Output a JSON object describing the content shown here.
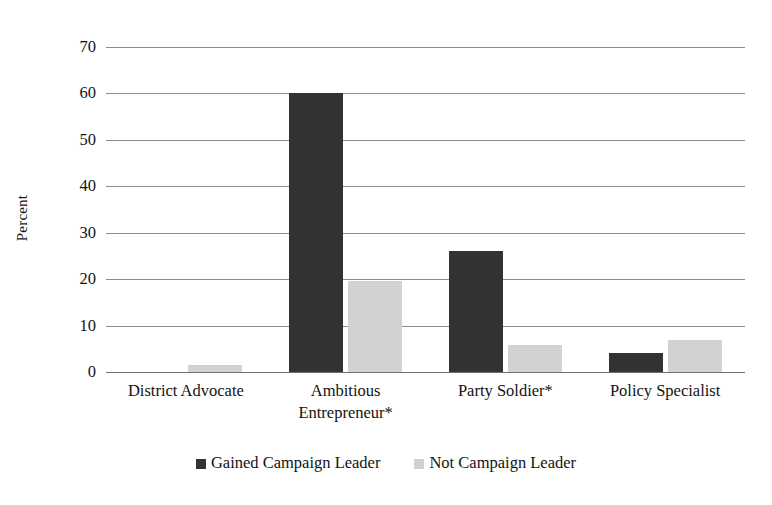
{
  "chart_data": {
    "type": "bar",
    "title": "",
    "xlabel": "",
    "ylabel": "Percent",
    "ylim": [
      0,
      70
    ],
    "ytick_step": 10,
    "yticks": [
      70,
      60,
      50,
      40,
      30,
      20,
      10,
      0
    ],
    "grid": true,
    "legend_position": "bottom",
    "categories": [
      "District Advocate",
      "Ambitious\nEntrepreneur*",
      "Party Soldier*",
      "Policy Specialist"
    ],
    "series": [
      {
        "name": "Gained Campaign Leader",
        "color": "#333333",
        "values": [
          0,
          60,
          26,
          4.2
        ]
      },
      {
        "name": "Not Campaign Leader",
        "color": "#d2d2d2",
        "values": [
          1.5,
          19.5,
          5.8,
          6.9
        ]
      }
    ]
  },
  "axis": {
    "y_title": "Percent",
    "y_tick_labels": [
      "70",
      "60",
      "50",
      "40",
      "30",
      "20",
      "10",
      "0"
    ],
    "x_tick_labels": [
      "District Advocate",
      "Ambitious\nEntrepreneur*",
      "Party Soldier*",
      "Policy Specialist"
    ]
  },
  "legend": {
    "items": [
      {
        "label": "Gained Campaign Leader",
        "color": "#333333"
      },
      {
        "label": "Not Campaign Leader",
        "color": "#d2d2d2"
      }
    ]
  },
  "colors": {
    "series_dark": "#333333",
    "series_light": "#d2d2d2",
    "gridline": "#8c8c8c",
    "text": "#131313",
    "background": "#ffffff"
  }
}
